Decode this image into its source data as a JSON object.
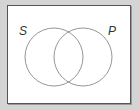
{
  "diagram": {
    "type": "venn",
    "sets": [
      {
        "label": "S",
        "cx": 54,
        "cy": 57,
        "r": 29
      },
      {
        "label": "P",
        "cx": 83,
        "cy": 57,
        "r": 29
      }
    ],
    "colors": {
      "background": "#d4d4d4",
      "frame": "#ffffff",
      "stroke": "#888888",
      "label": "#333333"
    }
  }
}
